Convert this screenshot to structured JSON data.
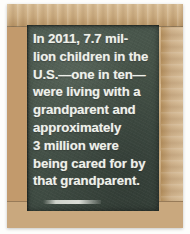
{
  "image": {
    "subject": "chalkboard-sign",
    "background_color": "#ffffff"
  },
  "frame": {
    "name": "wooden-picture-frame",
    "material": "light tan wood with visible grain",
    "colors": {
      "top_rail": "#cdae83",
      "left_rail": "#c29a6c",
      "right_rail": "#cdb08a",
      "bottom_rail": "#c9a87e"
    }
  },
  "chalkboard": {
    "name": "green-chalkboard",
    "surface_color": "#465348",
    "chalk_color": "#eef0ea",
    "message_lines": [
      "In 2011, 7.7 mil-",
      "lion children in the",
      "U.S.—one in ten—",
      "were living with a",
      "grandparent and",
      "approximately",
      "3 million were",
      "being cared for by",
      "that grandparent."
    ],
    "message_full": "In 2011, 7.7 million children in the U.S.—one in ten—were living with a grandparent and approximately 3 million were being cared for by that grandparent.",
    "statistics": {
      "year": "2011",
      "children_living_with_grandparent": "7.7 million",
      "proportion": "one in ten",
      "country": "U.S.",
      "cared_for_by_grandparent": "3 million"
    }
  }
}
